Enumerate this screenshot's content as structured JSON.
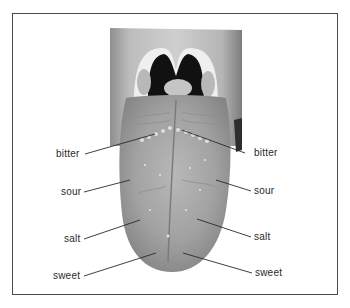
{
  "figure": {
    "frame_color": "#4a4a4a",
    "line_color": "#2a2a2a",
    "labels_left": [
      {
        "text": "bitter",
        "x": 56,
        "y": 149
      },
      {
        "text": "sour",
        "x": 61,
        "y": 187
      },
      {
        "text": "salt",
        "x": 64,
        "y": 234
      },
      {
        "text": "sweet",
        "x": 53,
        "y": 271
      }
    ],
    "labels_right": [
      {
        "text": "bitter",
        "x": 254,
        "y": 148
      },
      {
        "text": "sour",
        "x": 254,
        "y": 186
      },
      {
        "text": "salt",
        "x": 254,
        "y": 232
      },
      {
        "text": "sweet",
        "x": 255,
        "y": 268
      }
    ]
  }
}
